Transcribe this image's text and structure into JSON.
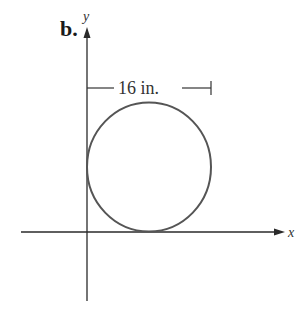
{
  "figure": {
    "part_label": "b.",
    "x_axis_label": "x",
    "y_axis_label": "y",
    "dimension_label": "16 in.",
    "colors": {
      "axis": "#2a2a2a",
      "circle": "#555555",
      "text": "#333333"
    },
    "circle": {
      "description": "circle tangent to both the y-axis and the x-axis, in the first quadrant",
      "diameter_label": "16 in."
    }
  }
}
